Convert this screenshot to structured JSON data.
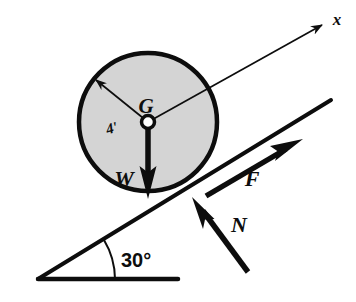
{
  "figure": {
    "type": "free-body-diagram",
    "background_color": "#ffffff",
    "ink_color": "#0d0d0d",
    "body_fill_color": "#d4d4d4"
  },
  "body": {
    "shape": "circle",
    "label": "G",
    "center_label_name": "center-of-gravity",
    "radius_label": "4'",
    "radius_value": 4,
    "radius_units": "ft",
    "center_px": [
      148,
      122
    ],
    "radius_px": 69
  },
  "incline": {
    "angle_label": "30°",
    "angle_value": 30,
    "angle_units": "degrees",
    "apex_px": [
      38,
      279
    ],
    "surface_end_px": [
      331,
      100
    ],
    "base_end_px": [
      178,
      279
    ]
  },
  "vectors": [
    {
      "name": "weight",
      "label": "W",
      "direction": "down",
      "style": "thick-filled-arrow",
      "from_px": [
        148,
        122
      ],
      "to_px": [
        148,
        196
      ]
    },
    {
      "name": "friction",
      "label": "F",
      "direction": "up-the-incline",
      "style": "thick-filled-arrow",
      "from_px": [
        206,
        195
      ],
      "to_px": [
        300,
        140
      ]
    },
    {
      "name": "normal-force",
      "label": "N",
      "direction": "perpendicular-to-incline",
      "style": "thick-filled-arrow",
      "from_px": [
        248,
        272
      ],
      "to_px": [
        194,
        199
      ]
    },
    {
      "name": "x-axis",
      "label": "x",
      "direction": "up-the-incline-through-G",
      "style": "thin-line-arrow",
      "from_px": [
        148,
        122
      ],
      "to_px": [
        326,
        23
      ]
    },
    {
      "name": "radius",
      "label": "4'",
      "direction": "up-left-from-center",
      "style": "thin-line-arrow",
      "from_px": [
        148,
        122
      ],
      "to_px": [
        94,
        79
      ]
    }
  ],
  "labels": {
    "center": "G",
    "radius": "4'",
    "weight": "W",
    "friction": "F",
    "normal": "N",
    "axis": "x",
    "angle": "30°"
  }
}
